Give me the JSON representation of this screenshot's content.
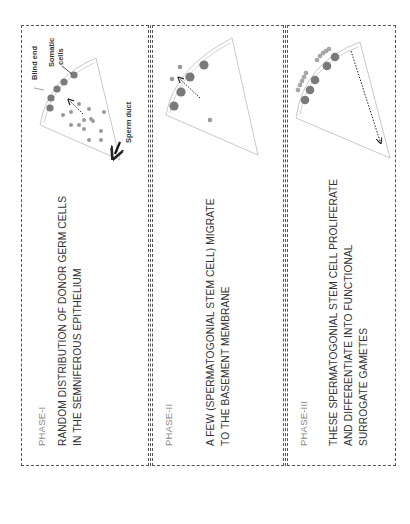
{
  "figure": {
    "panels": [
      {
        "phase": "PHASE-I",
        "description_lines": [
          "RANDOM DISTRIBUTION OF DONOR GERM CELLS",
          "IN THE SEMNIFEROUS EPITHELIUM"
        ],
        "labels": {
          "blind_end": "Blind end",
          "somatic_cells_1": "Somatic",
          "somatic_cells_2": "cells",
          "sperm_duct": "Sperm duct"
        }
      },
      {
        "phase": "PHASE-II",
        "description_lines": [
          "A FEW (SPERMATOGONIAL STEM CELL) MIGRATE",
          "TO THE BASEMENT MEMBRANE"
        ]
      },
      {
        "phase": "PHASE-III",
        "description_lines": [
          "THESE SPERMATOGONIAL STEM CELL PROLIFERATE",
          "AND DIFFERENTIATE INTO FUNCTIONAL",
          "SURROGATE GAMETES"
        ]
      }
    ],
    "colors": {
      "border": "#555555",
      "somatic_cell": "#7a7a7a",
      "germ_cell": "#9a9a9a",
      "tubule_outline": "#c8c8c8",
      "phase_text": "#8a8a8a",
      "body_text": "#333333"
    }
  }
}
